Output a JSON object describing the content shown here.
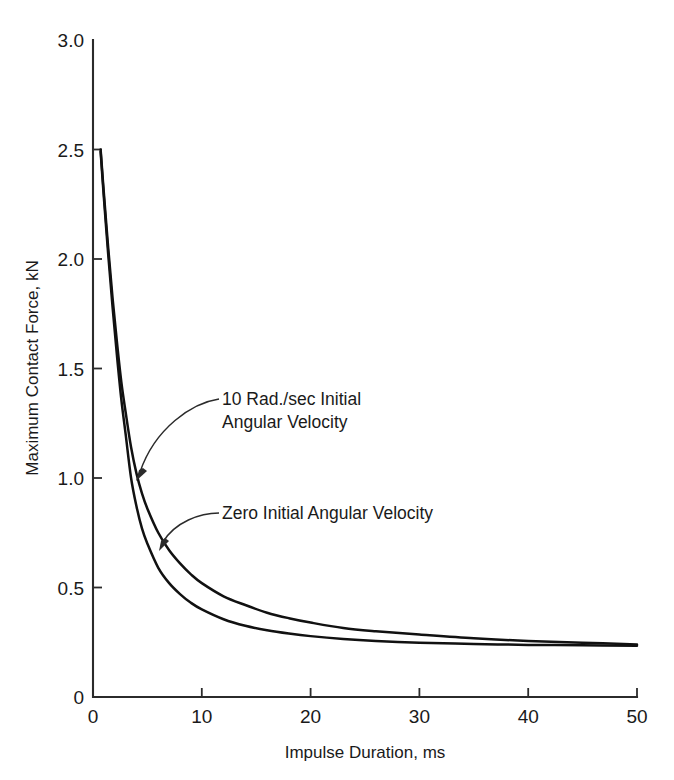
{
  "chart_data": {
    "type": "line",
    "title": "",
    "xlabel": "Impulse Duration, ms",
    "ylabel": "Maximum Contact Force, kN",
    "xlim": [
      0,
      50
    ],
    "ylim": [
      0,
      3.0
    ],
    "xticks": [
      "0",
      "10",
      "20",
      "30",
      "40",
      "50"
    ],
    "xtick_values": [
      0,
      10,
      20,
      30,
      40,
      50
    ],
    "yticks": [
      "0",
      "0.5",
      "1.0",
      "1.5",
      "2.0",
      "2.5",
      "3.0"
    ],
    "ytick_values": [
      0,
      0.5,
      1.0,
      1.5,
      2.0,
      2.5,
      3.0
    ],
    "grid": false,
    "legend_position": "inline-annotations",
    "series": [
      {
        "name": "10 Rad./sec Initial Angular Velocity",
        "x": [
          0.7,
          1.0,
          1.4,
          1.8,
          2.2,
          2.6,
          3.0,
          3.5,
          4.0,
          4.5,
          5.0,
          6.0,
          7.0,
          8.0,
          9.0,
          10.0,
          12.0,
          14.0,
          16.0,
          18.0,
          20.0,
          23.0,
          26.0,
          30.0,
          35.0,
          40.0,
          45.0,
          50.0
        ],
        "y": [
          2.5,
          2.3,
          2.05,
          1.82,
          1.62,
          1.44,
          1.3,
          1.14,
          1.02,
          0.93,
          0.86,
          0.75,
          0.67,
          0.61,
          0.56,
          0.52,
          0.46,
          0.42,
          0.385,
          0.36,
          0.34,
          0.315,
          0.3,
          0.285,
          0.268,
          0.256,
          0.248,
          0.24
        ]
      },
      {
        "name": "Zero Initial Angular Velocity",
        "x": [
          0.7,
          1.0,
          1.4,
          1.8,
          2.2,
          2.6,
          3.0,
          3.5,
          4.0,
          4.5,
          5.0,
          6.0,
          7.0,
          8.0,
          9.0,
          10.0,
          12.0,
          14.0,
          16.0,
          18.0,
          20.0,
          23.0,
          26.0,
          30.0,
          35.0,
          40.0,
          45.0,
          50.0
        ],
        "y": [
          2.49,
          2.28,
          2.02,
          1.78,
          1.56,
          1.36,
          1.2,
          1.0,
          0.87,
          0.77,
          0.7,
          0.59,
          0.52,
          0.47,
          0.43,
          0.4,
          0.355,
          0.325,
          0.305,
          0.29,
          0.278,
          0.265,
          0.256,
          0.248,
          0.242,
          0.238,
          0.236,
          0.234
        ]
      }
    ],
    "annotations": [
      {
        "id": "annotation-upper",
        "line1": "10 Rad./sec Initial",
        "line2": "Angular Velocity",
        "target_x": 4.2,
        "target_y": 1.0
      },
      {
        "id": "annotation-lower",
        "line1": "Zero Initial Angular Velocity",
        "line2": "",
        "target_x": 6.3,
        "target_y": 0.69
      }
    ]
  },
  "colors": {
    "curve": "#111111",
    "axis": "#2b2b2b",
    "text": "#1a1a1a",
    "background": "#ffffff"
  }
}
